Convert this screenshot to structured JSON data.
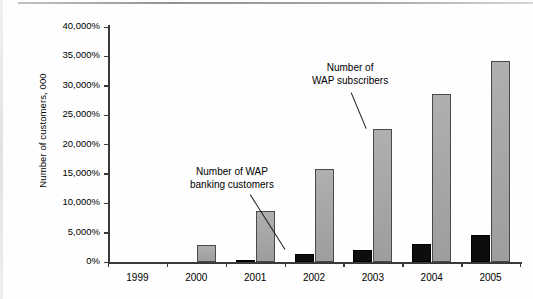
{
  "chart_data": {
    "type": "bar",
    "title": "",
    "subtitle": "",
    "xlabel": "",
    "ylabel": "Number of customers, 000",
    "categories": [
      "1999",
      "2000",
      "2001",
      "2002",
      "2003",
      "2004",
      "2005"
    ],
    "ylim": [
      0,
      40000
    ],
    "y_tick_step": 5000,
    "y_tick_labels": [
      "0%",
      "5,000%",
      "10,000%",
      "15,000%",
      "20,000%",
      "25,000%",
      "30,000%",
      "35,000%",
      "40,000%"
    ],
    "y_tick_values": [
      0,
      5000,
      10000,
      15000,
      20000,
      25000,
      30000,
      35000,
      40000
    ],
    "grid": false,
    "legend": "none",
    "series": [
      {
        "name": "Number of WAP banking customers",
        "color": "#0d0d0d",
        "values": [
          0,
          0,
          400,
          1300,
          2000,
          3000,
          4600
        ]
      },
      {
        "name": "Number of WAP subscribers",
        "color": "#a6a6a6",
        "values": [
          0,
          2900,
          8700,
          15800,
          22700,
          28600,
          34200
        ]
      }
    ],
    "annotations": [
      {
        "id": "banking",
        "line1": "Number of WAP",
        "line2": "banking customers",
        "points_to": "2002 black bar"
      },
      {
        "id": "subscribers",
        "line1": "Number of",
        "line2": "WAP subscribers",
        "points_to": "2003 gray bar"
      }
    ]
  }
}
